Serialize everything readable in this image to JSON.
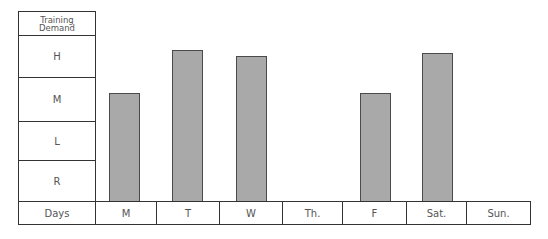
{
  "chart_data": {
    "type": "bar",
    "title": "",
    "ylabel": "Training Demand",
    "xlabel": "Days",
    "y_levels": [
      "R",
      "L",
      "M",
      "H"
    ],
    "y_levels_top_to_bottom": [
      "H",
      "M",
      "L",
      "R"
    ],
    "categories": [
      "M",
      "T",
      "W",
      "Th.",
      "F",
      "Sat.",
      "Sun."
    ],
    "values": [
      2.64,
      3.64,
      3.5,
      0,
      2.64,
      3.57,
      0
    ],
    "value_levels": [
      "M",
      "H",
      "H",
      "none",
      "M",
      "H",
      "none"
    ],
    "ylim": [
      0,
      4
    ],
    "grid": false,
    "legend": "none",
    "bar_color": "#a9a9a9",
    "bar_outline": "#4a4a4a"
  },
  "axis": {
    "header_line1": "Training",
    "header_line2": "Demand",
    "days_label": "Days"
  }
}
